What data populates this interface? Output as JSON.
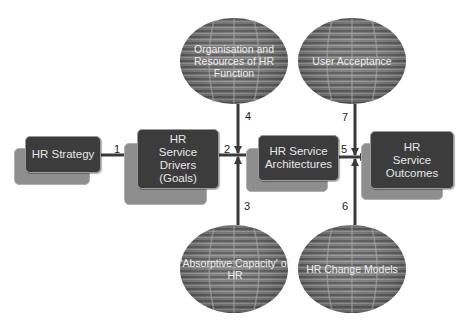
{
  "diagram": {
    "boxes": [
      {
        "id": "hr-strategy",
        "label": "HR Strategy"
      },
      {
        "id": "hr-service-drivers",
        "label": "HR Service Drivers (Goals)"
      },
      {
        "id": "hr-service-architectures",
        "label": "HR Service Architectures"
      },
      {
        "id": "hr-service-outcomes",
        "label": "HR Service Outcomes"
      }
    ],
    "ellipses": [
      {
        "id": "organisation-resources",
        "label": "Organisation and Resources of HR Function"
      },
      {
        "id": "user-acceptance",
        "label": "User Acceptance"
      },
      {
        "id": "absorptive-capacity",
        "label": "'Absorptive Capacity' of HR"
      },
      {
        "id": "hr-change-models",
        "label": "HR Change Models"
      }
    ],
    "arrows": [
      {
        "number": "1",
        "from": "HR Strategy",
        "to": "HR Service Drivers (Goals)"
      },
      {
        "number": "2",
        "from": "HR Service Drivers (Goals)",
        "to": "HR Service Architectures"
      },
      {
        "number": "3",
        "from": "'Absorptive Capacity' of HR",
        "to": "junction 2"
      },
      {
        "number": "4",
        "from": "Organisation and Resources of HR Function",
        "to": "junction 2"
      },
      {
        "number": "5",
        "from": "HR Service Architectures",
        "to": "HR Service Outcomes"
      },
      {
        "number": "6",
        "from": "HR Change Models",
        "to": "junction 5"
      },
      {
        "number": "7",
        "from": "User Acceptance",
        "to": "junction 5"
      }
    ],
    "colors": {
      "box_fill": "#3c3c3c",
      "box_shadow": "#8e8e8e",
      "ellipse_fill": "#7a7a7a",
      "connector": "#3a3a3a",
      "text_on_dark": "#e6e6e6"
    }
  }
}
